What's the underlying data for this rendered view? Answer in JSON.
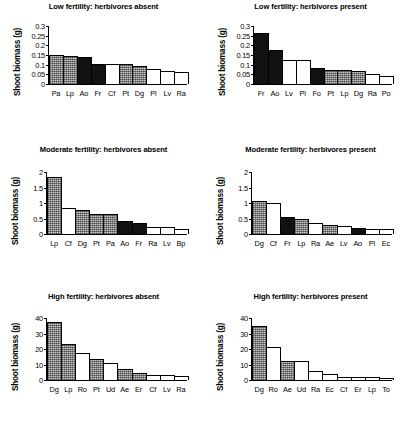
{
  "figure": {
    "ylabel": "Shoot biomass (g)",
    "panel_count": 6
  },
  "chart_data": [
    {
      "type": "bar",
      "title": "Low fertility: herbivores absent",
      "xlabel": "",
      "ylabel": "Shoot biomass (g)",
      "ylim": [
        0,
        0.3
      ],
      "yticks": [
        "0",
        "0.05",
        "0.1",
        "0.15",
        "0.2",
        "0.25",
        "0.3"
      ],
      "ytickvalues": [
        0,
        0.05,
        0.1,
        0.15,
        0.2,
        0.25,
        0.3
      ],
      "grid": false,
      "legend": "none",
      "categories": [
        "Pa",
        "Lp",
        "Ao",
        "Fr",
        "Cf",
        "Pt",
        "Dg",
        "Pl",
        "Lv",
        "Ra"
      ],
      "values": [
        0.15,
        0.145,
        0.142,
        0.104,
        0.103,
        0.103,
        0.094,
        0.079,
        0.067,
        0.062
      ],
      "fills": [
        "grey",
        "grey",
        "black",
        "black",
        "white",
        "grey",
        "grey",
        "white",
        "white",
        "white"
      ]
    },
    {
      "type": "bar",
      "title": "Low fertility: herbivores present",
      "xlabel": "",
      "ylabel": "Shoot biomass (g)",
      "ylim": [
        0,
        0.3
      ],
      "yticks": [
        "0",
        "0.05",
        "0.1",
        "0.15",
        "0.2",
        "0.25",
        "0.3"
      ],
      "ytickvalues": [
        0,
        0.05,
        0.1,
        0.15,
        0.2,
        0.25,
        0.3
      ],
      "grid": false,
      "legend": "none",
      "categories": [
        "Fr",
        "Ao",
        "Lv",
        "Pl",
        "Fo",
        "Pt",
        "Lp",
        "Dg",
        "Ra",
        "Po"
      ],
      "values": [
        0.265,
        0.177,
        0.122,
        0.122,
        0.083,
        0.074,
        0.071,
        0.067,
        0.054,
        0.041
      ],
      "fills": [
        "black",
        "black",
        "white",
        "white",
        "black",
        "grey",
        "grey",
        "grey",
        "white",
        "white"
      ]
    },
    {
      "type": "bar",
      "title": "Moderate fertility: herbivores absent",
      "xlabel": "",
      "ylabel": "Shoot biomass (g)",
      "ylim": [
        0,
        2
      ],
      "yticks": [
        "0",
        "0.5",
        "1",
        "1.5",
        "2"
      ],
      "ytickvalues": [
        0,
        0.5,
        1,
        1.5,
        2
      ],
      "grid": false,
      "legend": "none",
      "categories": [
        "Lp",
        "Cf",
        "Dg",
        "Pt",
        "Pa",
        "Ao",
        "Fr",
        "Ra",
        "Lv",
        "Bp"
      ],
      "values": [
        1.85,
        0.85,
        0.78,
        0.65,
        0.64,
        0.42,
        0.36,
        0.22,
        0.22,
        0.16
      ],
      "fills": [
        "grey",
        "white",
        "grey",
        "grey",
        "grey",
        "black",
        "black",
        "white",
        "white",
        "white"
      ]
    },
    {
      "type": "bar",
      "title": "Moderate fertility: herbivores present",
      "xlabel": "",
      "ylabel": "Shoot biomass (g)",
      "ylim": [
        0,
        2
      ],
      "yticks": [
        "0",
        "0.5",
        "1",
        "1.5",
        "2"
      ],
      "ytickvalues": [
        0,
        0.5,
        1,
        1.5,
        2
      ],
      "grid": false,
      "legend": "none",
      "categories": [
        "Dg",
        "Cf",
        "Fr",
        "Lp",
        "Ra",
        "Ae",
        "Lv",
        "Ao",
        "Pl",
        "Ec"
      ],
      "values": [
        1.05,
        1.0,
        0.55,
        0.48,
        0.35,
        0.28,
        0.26,
        0.18,
        0.17,
        0.15
      ],
      "fills": [
        "grey",
        "white",
        "black",
        "grey",
        "white",
        "grey",
        "white",
        "black",
        "white",
        "white"
      ]
    },
    {
      "type": "bar",
      "title": "High fertility: herbivores absent",
      "xlabel": "",
      "ylabel": "Shoot biomass (g)",
      "ylim": [
        0,
        40
      ],
      "yticks": [
        "0",
        "10",
        "20",
        "30",
        "40"
      ],
      "ytickvalues": [
        0,
        10,
        20,
        30,
        40
      ],
      "grid": false,
      "legend": "none",
      "categories": [
        "Dg",
        "Lp",
        "Ro",
        "Pt",
        "Ud",
        "Ae",
        "Er",
        "Cf",
        "Lv",
        "Ra"
      ],
      "values": [
        37.5,
        23.2,
        17.6,
        13.5,
        11.2,
        7.0,
        4.4,
        3.4,
        3.2,
        2.9
      ],
      "fills": [
        "grey",
        "grey",
        "white",
        "grey",
        "white",
        "grey",
        "grey",
        "white",
        "white",
        "white"
      ]
    },
    {
      "type": "bar",
      "title": "High fertility: herbivores present",
      "xlabel": "",
      "ylabel": "Shoot biomass (g)",
      "ylim": [
        0,
        40
      ],
      "yticks": [
        "0",
        "10",
        "20",
        "30",
        "40"
      ],
      "ytickvalues": [
        0,
        10,
        20,
        30,
        40
      ],
      "grid": false,
      "legend": "none",
      "categories": [
        "Dg",
        "Ro",
        "Ae",
        "Ud",
        "Ra",
        "Ec",
        "Cf",
        "Er",
        "Lp",
        "To"
      ],
      "values": [
        35.0,
        21.0,
        12.5,
        12.0,
        6.0,
        4.0,
        2.2,
        1.8,
        1.8,
        1.4
      ],
      "fills": [
        "grey",
        "white",
        "grey",
        "white",
        "white",
        "white",
        "white",
        "white",
        "white",
        "white"
      ]
    }
  ]
}
